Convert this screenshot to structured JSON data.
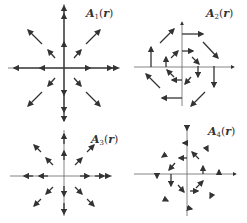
{
  "figure": {
    "panels": [
      {
        "id": "A1",
        "label": {
          "name": "A",
          "sub": "1",
          "arg": "r"
        },
        "description": "Radial outward field, magnitude increasing with distance",
        "origin": [
          64,
          68
        ],
        "label_pos": [
          86,
          7
        ],
        "arrows": [
          [
            64,
            68,
            64,
            42
          ],
          [
            64,
            42,
            64,
            14
          ],
          [
            64,
            14,
            64,
            6
          ],
          [
            64,
            68,
            64,
            95
          ],
          [
            64,
            95,
            64,
            112
          ],
          [
            64,
            68,
            90,
            68
          ],
          [
            90,
            68,
            112,
            68
          ],
          [
            112,
            68,
            118,
            68
          ],
          [
            64,
            68,
            40,
            68
          ],
          [
            40,
            68,
            14,
            68
          ],
          [
            55,
            58,
            48,
            50
          ],
          [
            42,
            44,
            28,
            30
          ],
          [
            74,
            58,
            81,
            50
          ],
          [
            86,
            44,
            100,
            30
          ],
          [
            55,
            78,
            48,
            86
          ],
          [
            42,
            92,
            28,
            106
          ],
          [
            74,
            78,
            81,
            86
          ],
          [
            86,
            92,
            100,
            106
          ]
        ]
      },
      {
        "id": "A2",
        "label": {
          "name": "A",
          "sub": "2",
          "arg": "r"
        },
        "description": "Clockwise rotational field around origin",
        "origin": [
          182,
          67
        ],
        "label_pos": [
          206,
          7
        ],
        "arrows": [
          [
            182,
            34,
            203,
            34
          ],
          [
            182,
            51,
            193,
            51
          ],
          [
            203,
            42,
            218,
            58
          ],
          [
            192,
            57,
            199,
            64
          ],
          [
            198,
            66,
            198,
            77
          ],
          [
            214,
            66,
            214,
            87
          ],
          [
            191,
            77,
            185,
            84
          ],
          [
            205,
            92,
            191,
            106
          ],
          [
            182,
            80,
            172,
            80
          ],
          [
            182,
            98,
            162,
            98
          ],
          [
            174,
            77,
            167,
            70
          ],
          [
            160,
            88,
            146,
            74
          ],
          [
            166,
            67,
            166,
            57
          ],
          [
            151,
            67,
            151,
            47
          ],
          [
            171,
            58,
            178,
            51
          ],
          [
            160,
            43,
            174,
            29
          ]
        ]
      },
      {
        "id": "A3",
        "label": {
          "name": "A",
          "sub": "3",
          "arg": "r"
        },
        "description": "Radial outward field, constant unit magnitude",
        "origin": [
          64,
          176
        ],
        "label_pos": [
          91,
          133
        ],
        "arrows": [
          [
            64,
            112,
            64,
            121
          ],
          [
            64,
            160,
            64,
            151
          ],
          [
            64,
            144,
            64,
            134
          ],
          [
            64,
            132,
            64,
            132
          ],
          [
            64,
            186,
            64,
            196
          ],
          [
            64,
            203,
            64,
            214
          ],
          [
            80,
            176,
            89,
            176
          ],
          [
            95,
            176,
            104,
            176
          ],
          [
            106,
            176,
            110,
            176
          ],
          [
            48,
            176,
            39,
            176
          ],
          [
            33,
            176,
            24,
            176
          ],
          [
            53,
            165,
            46,
            158
          ],
          [
            41,
            152,
            34,
            145
          ],
          [
            75,
            165,
            82,
            158
          ],
          [
            87,
            152,
            94,
            145
          ],
          [
            53,
            187,
            46,
            194
          ],
          [
            41,
            199,
            34,
            206
          ],
          [
            75,
            187,
            82,
            194
          ],
          [
            87,
            199,
            94,
            206
          ]
        ]
      },
      {
        "id": "A4",
        "label": {
          "name": "A",
          "sub": "4",
          "arg": "r"
        },
        "description": "Rotational field with magnitude decreasing with distance",
        "origin": [
          187,
          174
        ],
        "label_pos": [
          208,
          125
        ],
        "arrows": [
          [
            187,
            126,
            187,
            130
          ],
          [
            186,
            143,
            183,
            143
          ],
          [
            207,
            149,
            208,
            151
          ],
          [
            165,
            155,
            162,
            157
          ],
          [
            187,
            158,
            179,
            158
          ],
          [
            199,
            159,
            192,
            152
          ],
          [
            175,
            163,
            169,
            170
          ],
          [
            203,
            174,
            203,
            166
          ],
          [
            219,
            174,
            219,
            170
          ],
          [
            157,
            174,
            157,
            178
          ],
          [
            171,
            174,
            171,
            186
          ],
          [
            178,
            185,
            184,
            192
          ],
          [
            190,
            191,
            198,
            191
          ],
          [
            196,
            188,
            203,
            181
          ],
          [
            166,
            200,
            168,
            201
          ],
          [
            211,
            196,
            210,
            198
          ],
          [
            188,
            208,
            192,
            209
          ]
        ]
      }
    ]
  },
  "style": {
    "axis_color": "#555555",
    "arrow_color": "#333333",
    "background": "#ffffff"
  }
}
